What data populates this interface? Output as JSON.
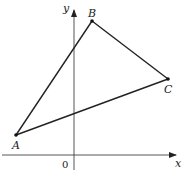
{
  "diagram": {
    "type": "coordinate-triangle",
    "axes": {
      "x_label": "x",
      "y_label": "y",
      "origin_label": "0"
    },
    "points": [
      {
        "name": "A",
        "label": "A"
      },
      {
        "name": "B",
        "label": "B"
      },
      {
        "name": "C",
        "label": "C"
      }
    ],
    "colors": {
      "stroke": "#222222",
      "background": "#ffffff"
    }
  }
}
